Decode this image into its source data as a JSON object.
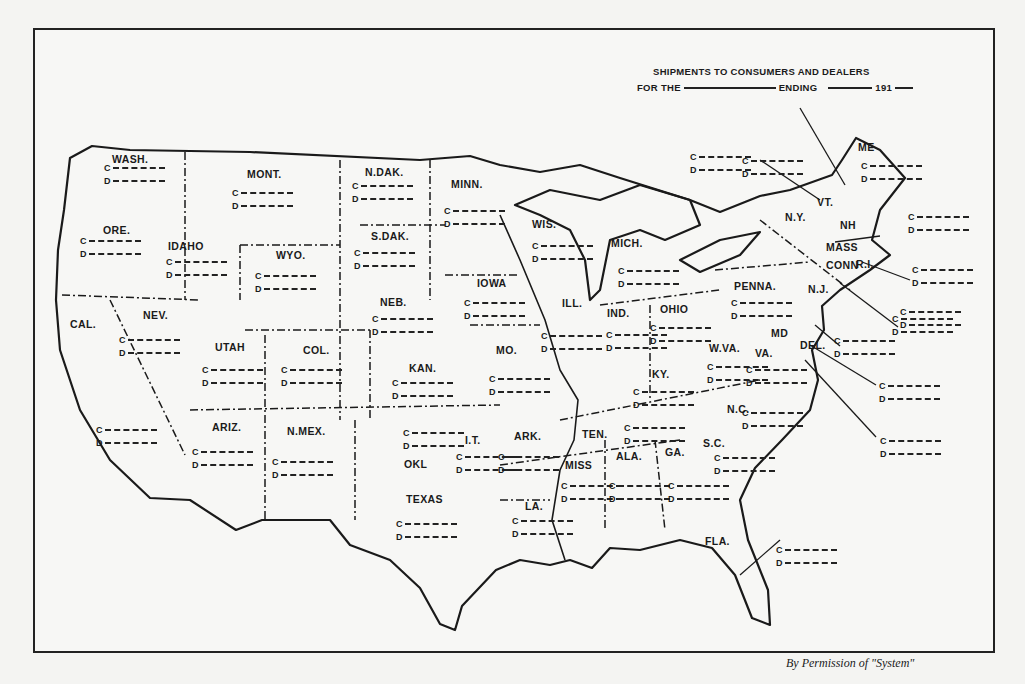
{
  "header": {
    "line1": "SHIPMENTS TO CONSUMERS AND DEALERS",
    "line2_for_the": "FOR THE",
    "line2_ending": "ENDING",
    "line2_year": "191"
  },
  "legend": {
    "consumers": "C",
    "dealers": "D"
  },
  "states": [
    {
      "abbr": "WASH.",
      "x": 112,
      "y": 153
    },
    {
      "abbr": "ORE.",
      "x": 103,
      "y": 224
    },
    {
      "abbr": "CAL.",
      "x": 70,
      "y": 318
    },
    {
      "abbr": "IDAHO",
      "x": 168,
      "y": 240
    },
    {
      "abbr": "NEV.",
      "x": 143,
      "y": 309
    },
    {
      "abbr": "MONT.",
      "x": 247,
      "y": 168
    },
    {
      "abbr": "WYO.",
      "x": 276,
      "y": 249
    },
    {
      "abbr": "UTAH",
      "x": 215,
      "y": 341
    },
    {
      "abbr": "COL.",
      "x": 303,
      "y": 344
    },
    {
      "abbr": "ARIZ.",
      "x": 212,
      "y": 421
    },
    {
      "abbr": "N.MEX.",
      "x": 287,
      "y": 425
    },
    {
      "abbr": "N.DAK.",
      "x": 365,
      "y": 166
    },
    {
      "abbr": "S.DAK.",
      "x": 371,
      "y": 230
    },
    {
      "abbr": "NEB.",
      "x": 380,
      "y": 296
    },
    {
      "abbr": "KAN.",
      "x": 409,
      "y": 362
    },
    {
      "abbr": "OKL",
      "x": 404,
      "y": 458
    },
    {
      "abbr": "I.T.",
      "x": 465,
      "y": 434
    },
    {
      "abbr": "TEXAS",
      "x": 406,
      "y": 493
    },
    {
      "abbr": "MINN.",
      "x": 451,
      "y": 178
    },
    {
      "abbr": "IOWA",
      "x": 477,
      "y": 277
    },
    {
      "abbr": "MO.",
      "x": 496,
      "y": 344
    },
    {
      "abbr": "ARK.",
      "x": 514,
      "y": 430
    },
    {
      "abbr": "LA.",
      "x": 525,
      "y": 500
    },
    {
      "abbr": "WIS.",
      "x": 532,
      "y": 218
    },
    {
      "abbr": "ILL.",
      "x": 562,
      "y": 297
    },
    {
      "abbr": "MICH.",
      "x": 611,
      "y": 237
    },
    {
      "abbr": "IND.",
      "x": 607,
      "y": 307
    },
    {
      "abbr": "OHIO",
      "x": 660,
      "y": 303
    },
    {
      "abbr": "KY.",
      "x": 652,
      "y": 368
    },
    {
      "abbr": "TEN.",
      "x": 582,
      "y": 428
    },
    {
      "abbr": "MISS",
      "x": 565,
      "y": 459
    },
    {
      "abbr": "ALA.",
      "x": 616,
      "y": 450
    },
    {
      "abbr": "GA.",
      "x": 665,
      "y": 446
    },
    {
      "abbr": "FLA.",
      "x": 705,
      "y": 535
    },
    {
      "abbr": "S.C.",
      "x": 703,
      "y": 437
    },
    {
      "abbr": "N.C.",
      "x": 727,
      "y": 403
    },
    {
      "abbr": "VA.",
      "x": 755,
      "y": 347
    },
    {
      "abbr": "W.VA.",
      "x": 709,
      "y": 342
    },
    {
      "abbr": "MD",
      "x": 771,
      "y": 327
    },
    {
      "abbr": "PENNA.",
      "x": 734,
      "y": 280
    },
    {
      "abbr": "N.Y.",
      "x": 785,
      "y": 211
    },
    {
      "abbr": "VT.",
      "x": 817,
      "y": 196
    },
    {
      "abbr": "NH",
      "x": 840,
      "y": 219
    },
    {
      "abbr": "ME",
      "x": 858,
      "y": 141
    },
    {
      "abbr": "MASS",
      "x": 826,
      "y": 241
    },
    {
      "abbr": "CONN",
      "x": 826,
      "y": 259
    },
    {
      "abbr": "R.I.",
      "x": 856,
      "y": 258
    },
    {
      "abbr": "N.J.",
      "x": 808,
      "y": 283
    },
    {
      "abbr": "DEL.",
      "x": 800,
      "y": 339
    }
  ],
  "entries": [
    {
      "x": 104,
      "y": 162
    },
    {
      "x": 80,
      "y": 235
    },
    {
      "x": 96,
      "y": 424
    },
    {
      "x": 166,
      "y": 256
    },
    {
      "x": 119,
      "y": 334
    },
    {
      "x": 232,
      "y": 187
    },
    {
      "x": 255,
      "y": 270
    },
    {
      "x": 202,
      "y": 364
    },
    {
      "x": 281,
      "y": 364
    },
    {
      "x": 192,
      "y": 446
    },
    {
      "x": 272,
      "y": 456
    },
    {
      "x": 352,
      "y": 180
    },
    {
      "x": 354,
      "y": 247
    },
    {
      "x": 372,
      "y": 313
    },
    {
      "x": 392,
      "y": 377
    },
    {
      "x": 403,
      "y": 427
    },
    {
      "x": 456,
      "y": 451
    },
    {
      "x": 396,
      "y": 518
    },
    {
      "x": 444,
      "y": 205
    },
    {
      "x": 464,
      "y": 297
    },
    {
      "x": 489,
      "y": 373
    },
    {
      "x": 498,
      "y": 451
    },
    {
      "x": 512,
      "y": 515
    },
    {
      "x": 532,
      "y": 240
    },
    {
      "x": 541,
      "y": 330
    },
    {
      "x": 618,
      "y": 265
    },
    {
      "x": 606,
      "y": 329
    },
    {
      "x": 650,
      "y": 322
    },
    {
      "x": 633,
      "y": 386
    },
    {
      "x": 624,
      "y": 422
    },
    {
      "x": 561,
      "y": 480
    },
    {
      "x": 609,
      "y": 480
    },
    {
      "x": 668,
      "y": 480
    },
    {
      "x": 714,
      "y": 452
    },
    {
      "x": 742,
      "y": 407
    },
    {
      "x": 746,
      "y": 364
    },
    {
      "x": 707,
      "y": 361
    },
    {
      "x": 731,
      "y": 297
    },
    {
      "x": 861,
      "y": 160
    },
    {
      "x": 742,
      "y": 155
    },
    {
      "x": 690,
      "y": 151
    },
    {
      "x": 908,
      "y": 211
    },
    {
      "x": 912,
      "y": 264
    },
    {
      "x": 900,
      "y": 306
    },
    {
      "x": 892,
      "y": 313
    },
    {
      "x": 834,
      "y": 335
    },
    {
      "x": 879,
      "y": 380
    },
    {
      "x": 880,
      "y": 435
    },
    {
      "x": 776,
      "y": 544
    }
  ],
  "credit": "By Permission of \"System\""
}
